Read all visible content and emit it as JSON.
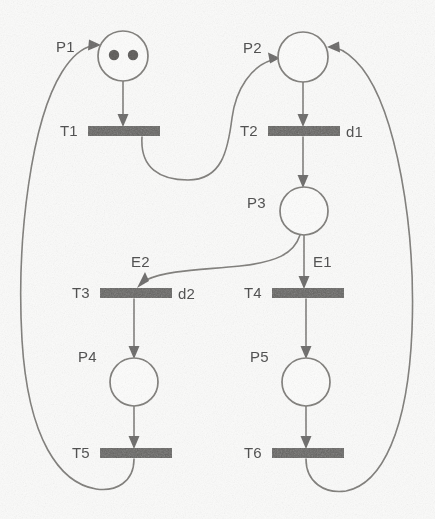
{
  "diagram": {
    "type": "petri-net",
    "background_color": "#fbfbfa",
    "line_color": "#7d7b78",
    "bar_color": "#5c5b59",
    "label_color": "#4a4a4a",
    "places": [
      {
        "id": "P1",
        "label": "P1",
        "cx": 123,
        "cy": 56,
        "r": 25,
        "tokens": 2,
        "label_x": 56,
        "label_y": 52
      },
      {
        "id": "P2",
        "label": "P2",
        "cx": 303,
        "cy": 57,
        "r": 25,
        "tokens": 0,
        "label_x": 243,
        "label_y": 53
      },
      {
        "id": "P3",
        "label": "P3",
        "cx": 304,
        "cy": 211,
        "r": 24,
        "tokens": 0,
        "label_x": 247,
        "label_y": 208
      },
      {
        "id": "P4",
        "label": "P4",
        "cx": 134,
        "cy": 382,
        "r": 24,
        "tokens": 0,
        "label_x": 78,
        "label_y": 362
      },
      {
        "id": "P5",
        "label": "P5",
        "cx": 306,
        "cy": 382,
        "r": 24,
        "tokens": 0,
        "label_x": 250,
        "label_y": 362
      }
    ],
    "transitions": [
      {
        "id": "T1",
        "label": "T1",
        "x": 88,
        "y": 126,
        "w": 72,
        "h": 10,
        "label_x": 60,
        "label_y": 136,
        "annotation": "",
        "annotation_x": 0,
        "annotation_y": 0
      },
      {
        "id": "T2",
        "label": "T2",
        "x": 268,
        "y": 126,
        "w": 72,
        "h": 10,
        "label_x": 240,
        "label_y": 136,
        "annotation": "d1",
        "annotation_x": 346,
        "annotation_y": 137
      },
      {
        "id": "T3",
        "label": "T3",
        "x": 100,
        "y": 288,
        "w": 72,
        "h": 10,
        "label_x": 72,
        "label_y": 298,
        "annotation": "d2",
        "annotation_x": 178,
        "annotation_y": 299
      },
      {
        "id": "T4",
        "label": "T4",
        "x": 272,
        "y": 288,
        "w": 72,
        "h": 10,
        "label_x": 244,
        "label_y": 298,
        "annotation": "",
        "annotation_x": 0,
        "annotation_y": 0
      },
      {
        "id": "T5",
        "label": "T5",
        "x": 100,
        "y": 448,
        "w": 72,
        "h": 10,
        "label_x": 72,
        "label_y": 458,
        "annotation": "",
        "annotation_x": 0,
        "annotation_y": 0
      },
      {
        "id": "T6",
        "label": "T6",
        "x": 272,
        "y": 448,
        "w": 72,
        "h": 10,
        "label_x": 244,
        "label_y": 458,
        "annotation": "",
        "annotation_x": 0,
        "annotation_y": 0
      }
    ],
    "arc_labels": [
      {
        "id": "E2",
        "label": "E2",
        "x": 131,
        "y": 267
      },
      {
        "id": "E1",
        "label": "E1",
        "x": 313,
        "y": 267
      }
    ],
    "arcs": [
      {
        "from": "P1",
        "to": "T1",
        "kind": "straight-down"
      },
      {
        "from": "T1",
        "to": "P2",
        "kind": "s-curve-right"
      },
      {
        "from": "P2",
        "to": "T2",
        "kind": "straight-down"
      },
      {
        "from": "T2",
        "to": "P3",
        "kind": "straight-down"
      },
      {
        "from": "P3",
        "to": "T4",
        "kind": "straight-down",
        "arc_label": "E1"
      },
      {
        "from": "P3",
        "to": "T3",
        "kind": "s-curve-left",
        "arc_label": "E2"
      },
      {
        "from": "T3",
        "to": "P4",
        "kind": "straight-down"
      },
      {
        "from": "T4",
        "to": "P5",
        "kind": "straight-down"
      },
      {
        "from": "P4",
        "to": "T5",
        "kind": "straight-down"
      },
      {
        "from": "P5",
        "to": "T6",
        "kind": "straight-down"
      },
      {
        "from": "T5",
        "to": "P1",
        "kind": "outer-loop-left"
      },
      {
        "from": "T6",
        "to": "P2",
        "kind": "outer-loop-right"
      }
    ]
  }
}
